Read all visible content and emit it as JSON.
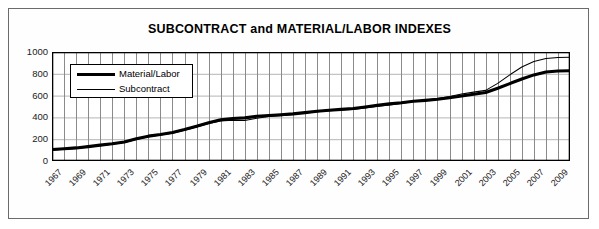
{
  "chart_data": {
    "type": "line",
    "title": "SUBCONTRACT and MATERIAL/LABOR INDEXES",
    "xlabel": "",
    "ylabel": "",
    "grid": true,
    "legend_position": "top-left-inside",
    "xlim": [
      1967,
      2010
    ],
    "ylim": [
      0,
      1000
    ],
    "ytick_labels": [
      "0",
      "200",
      "400",
      "600",
      "800",
      "1000"
    ],
    "ytick_values": [
      0,
      200,
      400,
      600,
      800,
      1000
    ],
    "xtick_labels": [
      "1967",
      "1969",
      "1971",
      "1973",
      "1975",
      "1977",
      "1979",
      "1981",
      "1983",
      "1985",
      "1987",
      "1989",
      "1991",
      "1993",
      "1995",
      "1997",
      "1999",
      "2001",
      "2003",
      "2005",
      "2007",
      "2009"
    ],
    "x": [
      1967,
      1968,
      1969,
      1970,
      1971,
      1972,
      1973,
      1974,
      1975,
      1976,
      1977,
      1978,
      1979,
      1980,
      1981,
      1982,
      1983,
      1984,
      1985,
      1986,
      1987,
      1988,
      1989,
      1990,
      1991,
      1992,
      1993,
      1994,
      1995,
      1996,
      1997,
      1998,
      1999,
      2000,
      2001,
      2002,
      2003,
      2004,
      2005,
      2006,
      2007,
      2008,
      2009,
      2010
    ],
    "series": [
      {
        "name": "Material/Labor",
        "line_width": "thick",
        "color": "#000000",
        "values": [
          105,
          112,
          120,
          132,
          146,
          158,
          175,
          205,
          228,
          243,
          262,
          288,
          318,
          350,
          378,
          390,
          396,
          410,
          418,
          424,
          432,
          444,
          456,
          466,
          474,
          482,
          496,
          512,
          524,
          534,
          548,
          556,
          566,
          580,
          596,
          612,
          628,
          668,
          710,
          752,
          790,
          816,
          826,
          828
        ]
      },
      {
        "name": "Subcontract",
        "line_width": "thin",
        "color": "#000000",
        "values": [
          100,
          108,
          116,
          128,
          141,
          154,
          170,
          198,
          222,
          238,
          256,
          282,
          312,
          344,
          368,
          374,
          372,
          392,
          408,
          416,
          426,
          440,
          452,
          462,
          468,
          474,
          486,
          500,
          514,
          528,
          546,
          560,
          574,
          592,
          614,
          632,
          648,
          712,
          790,
          862,
          912,
          940,
          950,
          952
        ]
      }
    ]
  },
  "legend": {
    "items": [
      {
        "label": "Material/Labor",
        "swatch": "thick-line-swatch"
      },
      {
        "label": "Subcontract",
        "swatch": "thin-line-swatch"
      }
    ]
  },
  "colors": {
    "line": "#000000",
    "axis": "#000000",
    "vertical_gridline": "#8a8a8a",
    "horizontal_gridline": "#b5b5b5",
    "frame": "#6b6b6b",
    "background": "#ffffff"
  }
}
